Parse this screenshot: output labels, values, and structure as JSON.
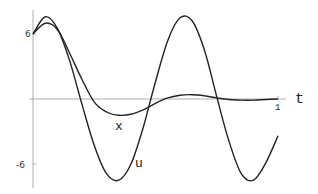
{
  "chart_data": {
    "type": "line",
    "title": "",
    "xlabel": "t",
    "ylabel": "",
    "xlim": [
      0,
      1
    ],
    "ylim": [
      -7.6,
      7.6
    ],
    "grid": false,
    "legend": "none (curves labeled inline)",
    "x_ticks": [
      "1"
    ],
    "y_ticks": [
      "6",
      "-6"
    ],
    "annotations": [
      {
        "text": "x",
        "near": "minimum of x curve, t≈0.36"
      },
      {
        "text": "u",
        "near": "u curve at t≈0.44, y≈-6"
      }
    ],
    "series": [
      {
        "name": "u",
        "t": [
          0,
          0.05,
          0.1,
          0.15,
          0.2,
          0.25,
          0.3,
          0.35,
          0.4,
          0.45,
          0.5,
          0.55,
          0.6,
          0.65,
          0.7,
          0.75,
          0.8,
          0.85,
          0.9,
          0.95,
          1.0
        ],
        "values": [
          6.0,
          7.6,
          6.5,
          3.5,
          -0.5,
          -4.3,
          -6.9,
          -7.5,
          -6.0,
          -2.6,
          1.6,
          5.4,
          7.5,
          7.2,
          4.5,
          0.2,
          -3.9,
          -6.9,
          -7.5,
          -5.9,
          -3.4
        ]
      },
      {
        "name": "x",
        "t": [
          0,
          0.05,
          0.1,
          0.15,
          0.2,
          0.25,
          0.3,
          0.35,
          0.4,
          0.45,
          0.5,
          0.55,
          0.6,
          0.65,
          0.7,
          0.75,
          0.8,
          0.85,
          0.9,
          0.95,
          1.0
        ],
        "values": [
          6.0,
          7.0,
          6.4,
          4.2,
          1.8,
          -0.3,
          -1.2,
          -1.5,
          -1.4,
          -1.0,
          -0.4,
          0.1,
          0.35,
          0.4,
          0.3,
          0.1,
          -0.05,
          -0.1,
          -0.1,
          -0.05,
          0.0
        ]
      }
    ]
  },
  "labels": {
    "y_top": "6",
    "y_bottom": "-6",
    "x_tick": "1",
    "x_axis": "t",
    "curve_x": "x",
    "curve_u": "u"
  }
}
